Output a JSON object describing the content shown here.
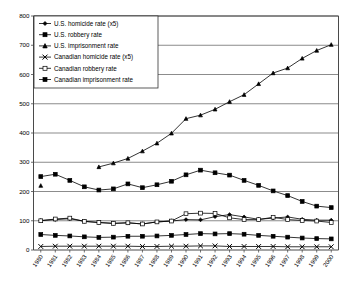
{
  "chart_data": {
    "type": "line",
    "title": "",
    "xlabel": "",
    "ylabel": "",
    "ylim": [
      0,
      800
    ],
    "ytick_values": [
      0,
      100,
      200,
      300,
      400,
      500,
      600,
      700,
      800
    ],
    "ytick_labels": [
      "0",
      "100",
      "200",
      "300",
      "400",
      "500",
      "600",
      "700",
      "800"
    ],
    "grid": true,
    "legend_position": "upper-left",
    "x": [
      1980,
      1981,
      1982,
      1983,
      1984,
      1985,
      1986,
      1987,
      1988,
      1989,
      1990,
      1991,
      1992,
      1993,
      1994,
      1995,
      1996,
      1997,
      1998,
      1999,
      2000
    ],
    "xtick_labels": [
      "1980",
      "1981",
      "1982",
      "1983",
      "1984",
      "1985",
      "1986",
      "1987",
      "1988",
      "1989",
      "1990",
      "1991",
      "1992",
      "1993",
      "1994",
      "1995",
      "1996",
      "1997",
      "1998",
      "1999",
      "2000"
    ],
    "series": [
      {
        "name": "U.S. homicide rate (x5)",
        "marker": "diamond",
        "values": [
          101,
          104,
          107,
          98,
          94,
          91,
          93,
          89,
          96,
          99,
          104,
          103,
          114,
          121,
          113,
          105,
          109,
          113,
          105,
          102,
          102
        ]
      },
      {
        "name": "U.S. robbery rate",
        "marker": "square-filled",
        "values": [
          251,
          259,
          238,
          216,
          205,
          209,
          226,
          213,
          223,
          235,
          257,
          273,
          264,
          256,
          238,
          221,
          202,
          186,
          166,
          150,
          145
        ]
      },
      {
        "name": "U.S. imprisonment rate",
        "marker": "triangle",
        "values": [
          220,
          null,
          null,
          null,
          284,
          297,
          313,
          338,
          365,
          399,
          449,
          461,
          481,
          507,
          531,
          568,
          605,
          622,
          655,
          682,
          702
        ]
      },
      {
        "name": "Canadian homicide rate (x5)",
        "marker": "cross-x",
        "values": [
          12,
          13,
          13,
          13,
          13,
          13,
          13,
          12,
          12,
          13,
          13,
          14,
          14,
          12,
          12,
          12,
          12,
          11,
          11,
          11,
          11
        ]
      },
      {
        "name": "Canadian robbery rate",
        "marker": "square-open",
        "values": [
          100,
          106,
          109,
          98,
          94,
          91,
          93,
          89,
          96,
          99,
          124,
          126,
          125,
          110,
          104,
          104,
          112,
          104,
          101,
          99,
          94
        ]
      },
      {
        "name": "Canadian imprisonment rate",
        "marker": "square-filled",
        "values": [
          53,
          50,
          48,
          45,
          43,
          44,
          47,
          47,
          48,
          50,
          53,
          56,
          55,
          56,
          54,
          50,
          47,
          44,
          41,
          39,
          38
        ]
      }
    ]
  },
  "legend": {
    "items": [
      {
        "label": "U.S. homicide rate (x5)",
        "marker": "diamond"
      },
      {
        "label": "U.S. robbery rate",
        "marker": "square-filled"
      },
      {
        "label": "U.S. imprisonment rate",
        "marker": "triangle"
      },
      {
        "label": "Canadian homicide rate (x5)",
        "marker": "cross-x"
      },
      {
        "label": "Canadian robbery rate",
        "marker": "square-open"
      },
      {
        "label": "Canadian imprisonment rate",
        "marker": "square-filled"
      }
    ]
  },
  "colors": {
    "line": "#000000",
    "grid": "#5a5a5a",
    "axis": "#4a4a4a",
    "background": "#ffffff"
  }
}
